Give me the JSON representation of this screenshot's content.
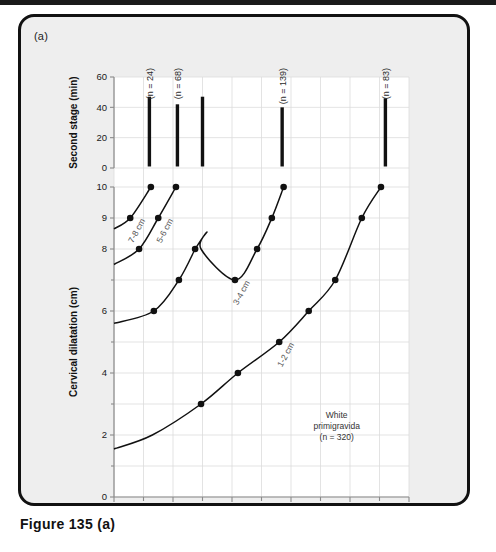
{
  "figure": {
    "panel_letter": "(a)",
    "caption": "Figure 135 (a)"
  },
  "chart_data": {
    "type": "line",
    "title": "",
    "subtitle": "",
    "annotation": {
      "line1": "White",
      "line2": "primigravida",
      "line3": "(n = 320)"
    },
    "xlabel": "Hours after admission",
    "xlim": [
      0,
      10
    ],
    "xticks": [
      0,
      2,
      4,
      6,
      8,
      10
    ],
    "xtick_labels": [
      "0",
      "2",
      "4",
      "6",
      "8",
      "10"
    ],
    "xminor_ticks": [
      1,
      3,
      5,
      7,
      9
    ],
    "grid": true,
    "upper_panel": {
      "ylabel": "Second stage (min)",
      "ylim": [
        0,
        60
      ],
      "yticks": [
        0,
        20,
        40,
        60
      ],
      "ytick_labels": [
        "0",
        "20",
        "40",
        "60"
      ],
      "type": "bar",
      "bars": [
        {
          "label": "(n = 24)",
          "x": 1.2,
          "y_low": 1,
          "y_high": 47,
          "n": 24
        },
        {
          "label": "(n = 68)",
          "x": 2.15,
          "y_low": 1,
          "y_high": 42,
          "n": 68
        },
        {
          "label": "",
          "x": 3.0,
          "y_low": 1,
          "y_high": 47,
          "n": null
        },
        {
          "label": "(n = 139)",
          "x": 5.7,
          "y_low": 1,
          "y_high": 40,
          "n": 139
        },
        {
          "label": "(n = 83)",
          "x": 9.2,
          "y_low": 1,
          "y_high": 46,
          "n": 83
        }
      ],
      "n_labels": [
        "(n = 24)",
        "(n = 68)",
        "(n = 139)",
        "(n = 83)"
      ]
    },
    "lower_panel": {
      "ylabel": "Cervical dilatation (cm)",
      "ylim": [
        0,
        10
      ],
      "y_inverted_axis": false,
      "yticks": [
        0,
        2,
        4,
        6,
        8,
        9,
        10
      ],
      "ytick_labels": [
        "0",
        "2",
        "4",
        "6",
        "8",
        "9",
        "10"
      ],
      "yminor_ticks": [
        1,
        3,
        5,
        7
      ],
      "series": [
        {
          "name": "7-8 cm",
          "label": "7-8 cm",
          "x": [
            0.0,
            0.55,
            1.25
          ],
          "y": [
            8.65,
            9.0,
            10.0
          ],
          "markers_x": [
            0.55,
            1.25
          ],
          "markers_y": [
            9.0,
            10.0
          ]
        },
        {
          "name": "5-6 cm",
          "label": "5-6 cm",
          "x": [
            0.0,
            0.85,
            1.5,
            2.1
          ],
          "y": [
            7.5,
            8.0,
            9.0,
            10.0
          ],
          "markers_x": [
            0.85,
            1.5,
            2.1
          ],
          "markers_y": [
            8.0,
            9.0,
            10.0
          ]
        },
        {
          "name": "3-4 cm left",
          "label": "",
          "x": [
            0.0,
            1.35,
            2.2,
            2.75
          ],
          "y": [
            5.6,
            6.0,
            7.0,
            8.0
          ],
          "markers_x": [
            1.35,
            2.2,
            2.75
          ],
          "markers_y": [
            6.0,
            7.0,
            8.0
          ],
          "continues": true
        },
        {
          "name": "3-4 cm",
          "label": "3-4 cm",
          "x": [
            2.75,
            3.15,
            2.95,
            4.1,
            4.85,
            5.35,
            5.75
          ],
          "y": [
            8.0,
            8.55,
            8.0,
            7.0,
            8.0,
            9.0,
            10.0
          ],
          "markers_x": [
            4.1,
            4.85,
            5.35,
            5.75
          ],
          "markers_y": [
            7.0,
            8.0,
            9.0,
            10.0
          ]
        },
        {
          "name": "1-2 cm",
          "label": "1-2 cm",
          "x": [
            0.0,
            1.3,
            2.95,
            4.2,
            5.6,
            6.6,
            7.5,
            8.4,
            9.05
          ],
          "y": [
            1.55,
            2.0,
            3.0,
            4.0,
            5.0,
            6.0,
            7.0,
            9.0,
            10.0
          ],
          "markers_x": [
            2.95,
            4.2,
            5.6,
            6.6,
            7.5,
            8.4,
            9.05
          ],
          "markers_y": [
            3.0,
            4.0,
            5.0,
            6.0,
            7.0,
            9.0,
            10.0
          ]
        }
      ]
    }
  }
}
